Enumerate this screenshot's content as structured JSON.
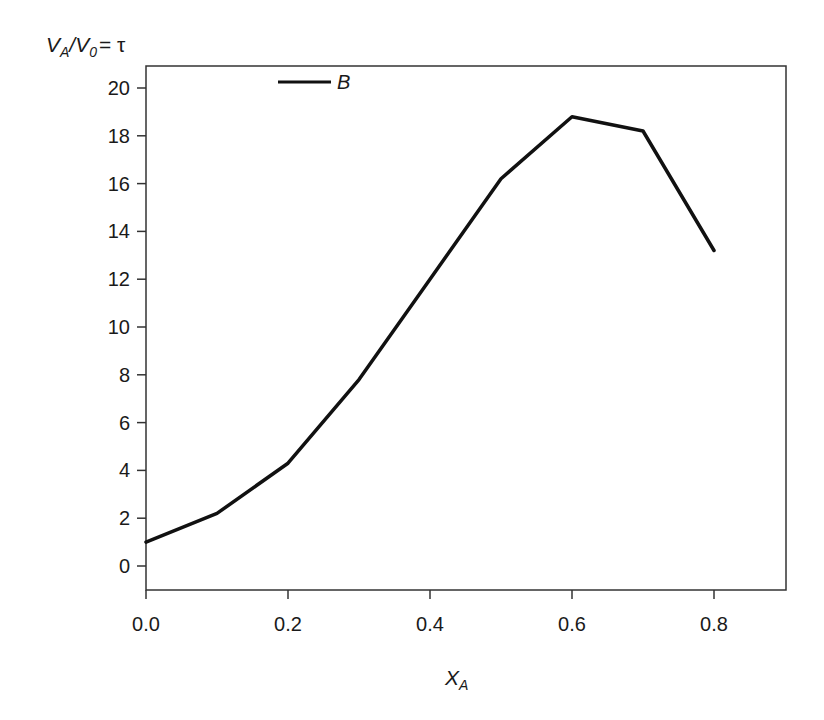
{
  "chart_data": {
    "type": "line",
    "title": "",
    "xlabel": "X_A",
    "ylabel": "V_A/V_0 = τ",
    "xlim": [
      0.0,
      0.9
    ],
    "ylim": [
      -1.0,
      21.0
    ],
    "x_ticks": [
      0.0,
      0.2,
      0.4,
      0.6,
      0.8
    ],
    "x_tick_labels": [
      "0.0",
      "0.2",
      "0.4",
      "0.6",
      "0.8"
    ],
    "y_ticks": [
      0,
      2,
      4,
      6,
      8,
      10,
      12,
      14,
      16,
      18,
      20
    ],
    "y_tick_labels": [
      "0",
      "2",
      "4",
      "6",
      "8",
      "10",
      "12",
      "14",
      "16",
      "18",
      "20"
    ],
    "grid": false,
    "legend_position": "upper-left-inside",
    "x": [
      0.0,
      0.1,
      0.2,
      0.3,
      0.4,
      0.5,
      0.6,
      0.7,
      0.8
    ],
    "series": [
      {
        "name": "B",
        "color": "#111111",
        "values": [
          1.0,
          2.2,
          4.3,
          7.8,
          12.0,
          16.2,
          18.8,
          18.2,
          13.2
        ]
      }
    ]
  },
  "labels": {
    "y_main": "V",
    "y_sub1": "A",
    "y_mid": "/V",
    "y_sub2": "0",
    "y_tail": "= τ",
    "x_main": "X",
    "x_sub": "A",
    "legend": "B"
  }
}
